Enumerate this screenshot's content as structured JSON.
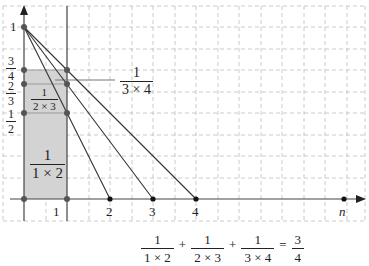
{
  "figure": {
    "y_axis_label": "1",
    "x_axis_label": "n",
    "x_ticks": [
      "1",
      "2",
      "3",
      "4"
    ],
    "y_fracs": [
      {
        "num": "3",
        "den": "4"
      },
      {
        "num": "2",
        "den": "3"
      },
      {
        "num": "1",
        "den": "2"
      }
    ],
    "area_labels": {
      "first": {
        "num": "1",
        "den": "1 × 2"
      },
      "second": {
        "num": "1",
        "den": "2 × 3"
      },
      "third": {
        "num": "1",
        "den": "3 × 4"
      }
    },
    "colors": {
      "shade": "#d3d3d3",
      "grid": "#bdbdbd",
      "axis": "#444444",
      "line": "#333333"
    }
  },
  "equation": {
    "terms": [
      {
        "num": "1",
        "den": "1 × 2"
      },
      {
        "num": "1",
        "den": "2 × 3"
      },
      {
        "num": "1",
        "den": "3 × 4"
      }
    ],
    "plus": "+",
    "equals": "=",
    "result": {
      "num": "3",
      "den": "4"
    }
  }
}
